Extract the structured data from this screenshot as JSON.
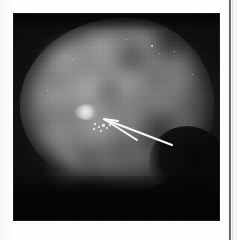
{
  "document": {
    "kind": "printed-page-scan",
    "caption": "",
    "page_rule_color": "#3a3a3a",
    "paper_color": "#fdfdfc"
  },
  "figure": {
    "name": "mammogram",
    "modality": "Mammography",
    "view": "craniocaudal",
    "plate_background_color": "#050505",
    "tissue_color": "#7a7a7a",
    "annotation_color": "#ffffff",
    "lesion_color": "#f2f2f2"
  },
  "annotations": {
    "arrow": {
      "name": "pointer-arrow",
      "label": "",
      "tail_x": 172,
      "tail_y": 145,
      "head_x": 104,
      "head_y": 119,
      "color": "#ffffff"
    },
    "second_arrow": {
      "name": "pointer-arrow-secondary",
      "label": "",
      "tail_x": 137,
      "tail_y": 140,
      "head_x": 104,
      "head_y": 119,
      "color": "#ffffff"
    },
    "lesion_marker": {
      "name": "calcification-cluster",
      "label": "",
      "x": 87,
      "y": 112
    }
  },
  "tissue_blobs": [
    {
      "x": 26,
      "y": 24,
      "w": 52,
      "h": 44,
      "c": "rgba(150,150,150,0.42)"
    },
    {
      "x": 60,
      "y": 16,
      "w": 62,
      "h": 40,
      "c": "rgba(160,160,160,0.38)"
    },
    {
      "x": 104,
      "y": 12,
      "w": 54,
      "h": 44,
      "c": "rgba(150,150,150,0.34)"
    },
    {
      "x": 140,
      "y": 30,
      "w": 48,
      "h": 46,
      "c": "rgba(130,130,130,0.30)"
    },
    {
      "x": 18,
      "y": 64,
      "w": 46,
      "h": 44,
      "c": "rgba(150,150,150,0.36)"
    },
    {
      "x": 46,
      "y": 56,
      "w": 58,
      "h": 48,
      "c": "rgba(170,170,170,0.40)"
    },
    {
      "x": 88,
      "y": 50,
      "w": 52,
      "h": 46,
      "c": "rgba(145,145,145,0.32)"
    },
    {
      "x": 128,
      "y": 66,
      "w": 54,
      "h": 48,
      "c": "rgba(135,135,135,0.28)"
    },
    {
      "x": 22,
      "y": 100,
      "w": 54,
      "h": 50,
      "c": "rgba(165,165,165,0.40)"
    },
    {
      "x": 58,
      "y": 94,
      "w": 56,
      "h": 46,
      "c": "rgba(175,175,175,0.44)"
    },
    {
      "x": 98,
      "y": 92,
      "w": 46,
      "h": 40,
      "c": "rgba(140,140,140,0.26)"
    },
    {
      "x": 30,
      "y": 132,
      "w": 52,
      "h": 44,
      "c": "rgba(155,155,155,0.36)"
    },
    {
      "x": 70,
      "y": 136,
      "w": 50,
      "h": 40,
      "c": "rgba(150,150,150,0.30)"
    },
    {
      "x": 104,
      "y": 128,
      "w": 44,
      "h": 36,
      "c": "rgba(130,130,130,0.24)"
    },
    {
      "x": 150,
      "y": 96,
      "w": 40,
      "h": 40,
      "c": "rgba(120,120,120,0.22)"
    },
    {
      "x": 150,
      "y": 54,
      "w": 36,
      "h": 34,
      "c": "rgba(125,125,125,0.24)"
    }
  ],
  "tissue_shadows": [
    {
      "x": 96,
      "y": 24,
      "w": 46,
      "h": 36,
      "c": "rgba(40,40,40,0.45)"
    },
    {
      "x": 132,
      "y": 14,
      "w": 44,
      "h": 34,
      "c": "rgba(35,35,35,0.50)"
    },
    {
      "x": 118,
      "y": 92,
      "w": 56,
      "h": 50,
      "c": "rgba(30,30,30,0.48)"
    },
    {
      "x": 60,
      "y": 150,
      "w": 60,
      "h": 40,
      "c": "rgba(35,35,35,0.42)"
    },
    {
      "x": 12,
      "y": 142,
      "w": 46,
      "h": 40,
      "c": "rgba(30,30,30,0.40)"
    },
    {
      "x": 78,
      "y": 62,
      "w": 34,
      "h": 30,
      "c": "rgba(45,45,45,0.32)"
    }
  ],
  "calcification_specks": [
    {
      "x": 80,
      "y": 109,
      "s": 2.4
    },
    {
      "x": 84,
      "y": 112,
      "s": 2.0
    },
    {
      "x": 88,
      "y": 110,
      "s": 2.8
    },
    {
      "x": 92,
      "y": 113,
      "s": 2.0
    },
    {
      "x": 86,
      "y": 116,
      "s": 1.8
    },
    {
      "x": 79,
      "y": 114,
      "s": 1.6
    },
    {
      "x": 95,
      "y": 110,
      "s": 1.6
    }
  ],
  "film_specks": [
    {
      "x": 137,
      "y": 31,
      "s": 1.8
    },
    {
      "x": 145,
      "y": 39,
      "s": 1.4
    },
    {
      "x": 112,
      "y": 25,
      "s": 1.3
    },
    {
      "x": 160,
      "y": 37,
      "s": 1.2
    },
    {
      "x": 58,
      "y": 45,
      "s": 1.1
    },
    {
      "x": 33,
      "y": 76,
      "s": 1.2
    },
    {
      "x": 178,
      "y": 60,
      "s": 1.1
    }
  ]
}
